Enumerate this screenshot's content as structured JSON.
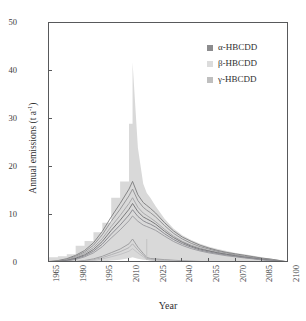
{
  "chart_data": {
    "type": "line",
    "title": "",
    "xlabel": "Year",
    "ylabel": "Annual emissions (t a",
    "ylabel_exponent": "-1",
    "ylabel_suffix": ")",
    "xlim": [
      1965,
      2100
    ],
    "ylim": [
      0,
      50
    ],
    "xticks": [
      1965,
      1980,
      1995,
      2010,
      2025,
      2040,
      2055,
      2070,
      2085,
      2100
    ],
    "yticks": [
      0,
      10,
      20,
      30,
      40,
      50
    ],
    "grid": false,
    "legend_position": "top-right-inside",
    "legend": [
      {
        "label": "α-HBCDD",
        "color": "#8c8c8e"
      },
      {
        "label": "β-HBCDD",
        "color": "#dcdcdc"
      },
      {
        "label": "γ-HBCDD",
        "color": "#bfbfbf"
      }
    ],
    "x": [
      1965,
      1970,
      1975,
      1980,
      1985,
      1990,
      1995,
      2000,
      2005,
      2010,
      2012,
      2015,
      2018,
      2020,
      2022,
      2025,
      2030,
      2035,
      2040,
      2045,
      2050,
      2055,
      2060,
      2065,
      2070,
      2075,
      2080,
      2085,
      2090,
      2095,
      2100
    ],
    "uncertainty_band": {
      "name": "total uncertainty envelope",
      "color": "#d9d9d9",
      "upper": [
        1.2,
        1.4,
        1.8,
        3.6,
        4.6,
        6.4,
        8.4,
        13.6,
        17.0,
        29.0,
        41.8,
        24.0,
        16.5,
        14.6,
        13.6,
        11.8,
        9.2,
        7.2,
        5.8,
        4.8,
        4.0,
        3.4,
        2.9,
        2.5,
        2.1,
        1.8,
        1.5,
        1.2,
        0.9,
        0.6,
        0.3
      ],
      "lower": [
        0.0,
        0.0,
        0.0,
        0.0,
        0.1,
        0.2,
        0.3,
        0.5,
        0.7,
        1.0,
        1.2,
        0.9,
        0.7,
        0.6,
        0.5,
        0.4,
        0.3,
        0.25,
        0.2,
        0.18,
        0.15,
        0.13,
        0.11,
        0.09,
        0.08,
        0.06,
        0.05,
        0.04,
        0.03,
        0.02,
        0.0
      ]
    },
    "series": [
      {
        "name": "γ-HBCDD upper scenario",
        "color": "#7a7a7c",
        "values": [
          0.3,
          0.5,
          0.9,
          1.6,
          2.6,
          4.2,
          6.6,
          9.6,
          12.4,
          15.4,
          17.0,
          14.2,
          12.6,
          12.0,
          11.4,
          10.4,
          8.4,
          6.7,
          5.4,
          4.5,
          3.7,
          3.1,
          2.6,
          2.2,
          1.9,
          1.6,
          1.3,
          1.0,
          0.8,
          0.5,
          0.2
        ]
      },
      {
        "name": "γ-HBCDD mid scenario",
        "color": "#8f8f91",
        "values": [
          0.25,
          0.42,
          0.78,
          1.4,
          2.3,
          3.7,
          5.9,
          8.7,
          11.2,
          14.0,
          15.4,
          13.0,
          11.6,
          11.0,
          10.5,
          9.6,
          7.8,
          6.2,
          5.0,
          4.1,
          3.4,
          2.9,
          2.4,
          2.1,
          1.7,
          1.4,
          1.2,
          0.9,
          0.7,
          0.45,
          0.18
        ]
      },
      {
        "name": "γ-HBCDD lower scenario",
        "color": "#a3a3a5",
        "values": [
          0.2,
          0.35,
          0.65,
          1.2,
          2.0,
          3.2,
          5.1,
          7.6,
          9.9,
          12.4,
          13.6,
          11.6,
          10.4,
          9.9,
          9.4,
          8.6,
          7.0,
          5.6,
          4.5,
          3.7,
          3.1,
          2.6,
          2.2,
          1.9,
          1.6,
          1.3,
          1.0,
          0.8,
          0.6,
          0.4,
          0.15
        ]
      },
      {
        "name": "α-HBCDD upper scenario",
        "color": "#6e6e70",
        "values": [
          0.18,
          0.3,
          0.55,
          1.0,
          1.7,
          2.8,
          4.5,
          6.8,
          8.9,
          11.2,
          12.4,
          10.7,
          9.6,
          9.2,
          8.8,
          8.1,
          6.6,
          5.3,
          4.3,
          3.5,
          2.9,
          2.5,
          2.1,
          1.8,
          1.5,
          1.2,
          1.0,
          0.75,
          0.55,
          0.35,
          0.13
        ]
      },
      {
        "name": "α-HBCDD mid scenario",
        "color": "#83838a",
        "values": [
          0.15,
          0.26,
          0.48,
          0.88,
          1.5,
          2.45,
          3.95,
          6.0,
          7.9,
          10.0,
          11.1,
          9.7,
          8.8,
          8.4,
          8.1,
          7.5,
          6.1,
          4.9,
          4.0,
          3.3,
          2.7,
          2.3,
          1.95,
          1.65,
          1.4,
          1.15,
          0.92,
          0.7,
          0.5,
          0.32,
          0.12
        ]
      },
      {
        "name": "α-HBCDD lower scenario",
        "color": "#97979c",
        "values": [
          0.12,
          0.21,
          0.4,
          0.74,
          1.28,
          2.1,
          3.4,
          5.2,
          6.9,
          8.8,
          9.8,
          8.7,
          7.9,
          7.6,
          7.3,
          6.8,
          5.6,
          4.5,
          3.65,
          3.0,
          2.5,
          2.1,
          1.8,
          1.5,
          1.28,
          1.05,
          0.85,
          0.64,
          0.46,
          0.29,
          0.11
        ]
      },
      {
        "name": "β-HBCDD upper scenario",
        "color": "#9a9a9c",
        "values": [
          0.05,
          0.09,
          0.16,
          0.3,
          0.52,
          0.86,
          1.4,
          2.15,
          2.9,
          4.0,
          5.0,
          3.3,
          2.0,
          1.15,
          0.95,
          0.85,
          0.7,
          0.58,
          0.47,
          0.39,
          0.32,
          0.27,
          0.23,
          0.19,
          0.16,
          0.13,
          0.11,
          0.08,
          0.06,
          0.04,
          0.015
        ]
      },
      {
        "name": "β-HBCDD mid scenario",
        "color": "#aeaeb0",
        "values": [
          0.04,
          0.07,
          0.13,
          0.24,
          0.42,
          0.69,
          1.12,
          1.72,
          2.35,
          3.2,
          4.0,
          2.7,
          1.65,
          0.95,
          0.8,
          0.7,
          0.58,
          0.48,
          0.39,
          0.32,
          0.27,
          0.22,
          0.19,
          0.16,
          0.13,
          0.11,
          0.09,
          0.07,
          0.05,
          0.03,
          0.012
        ]
      },
      {
        "name": "β-HBCDD lower scenario",
        "color": "#c0c0c2",
        "values": [
          0.03,
          0.05,
          0.1,
          0.18,
          0.31,
          0.52,
          0.84,
          1.3,
          1.78,
          2.45,
          3.0,
          2.1,
          1.3,
          0.76,
          0.63,
          0.56,
          0.46,
          0.38,
          0.31,
          0.26,
          0.21,
          0.18,
          0.15,
          0.13,
          0.11,
          0.09,
          0.07,
          0.055,
          0.04,
          0.025,
          0.01
        ]
      }
    ]
  }
}
